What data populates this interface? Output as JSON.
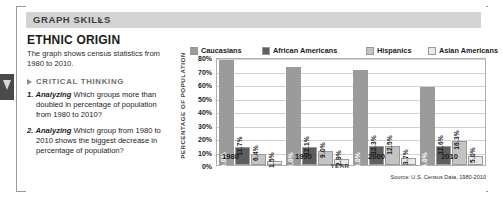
{
  "header": {
    "title": "GRAPH SKILLS",
    "chevron": "›"
  },
  "left": {
    "section_title": "ETHNIC ORIGIN",
    "description": "The graph shows census statistics from 1980 to 2010.",
    "critical_thinking_label": "CRITICAL THINKING",
    "questions": [
      {
        "num": "1.",
        "verb": "Analyzing",
        "text": "Which groups more than doubled in percentage of population from 1980 to 2010?"
      },
      {
        "num": "2.",
        "verb": "Analyzing",
        "text": "Which group from 1980 to 2010 shows the biggest decrease in percentage of population?"
      }
    ]
  },
  "colors": {
    "caucasians": "#9b9b9b",
    "african_americans": "#5e5e5e",
    "hispanics": "#c4c4c4",
    "asian_americans": "#e8e8e8",
    "header_band": "#d4d4d4",
    "grid": "#d2d2d2"
  },
  "chart_data": {
    "type": "bar",
    "title": "",
    "xlabel": "YEAR",
    "ylabel": "PERCENTAGE OF POPULATION",
    "ylim": [
      0,
      80
    ],
    "ytick_labels": [
      "80%",
      "70%",
      "60%",
      "50%",
      "40%",
      "30%",
      "20%",
      "10%",
      "0%"
    ],
    "ytick_values": [
      80,
      70,
      60,
      50,
      40,
      30,
      20,
      10,
      0
    ],
    "grid": true,
    "legend_position": "top",
    "categories": [
      "1980",
      "1990",
      "2000",
      "2010"
    ],
    "series": [
      {
        "name": "Caucasians",
        "color": "#9b9b9b",
        "values": [
          76.0,
          71.0,
          69.0,
          56.0
        ],
        "labels": [
          "76.0%",
          "71.0%",
          "69.0%",
          "56.0%"
        ]
      },
      {
        "name": "African Americans",
        "color": "#5e5e5e",
        "values": [
          11.7,
          12.1,
          12.3,
          12.6
        ],
        "labels": [
          "11.7%",
          "12.1%",
          "12.3%",
          "12.6%"
        ]
      },
      {
        "name": "Hispanics",
        "color": "#c4c4c4",
        "values": [
          6.4,
          9.0,
          12.5,
          16.3
        ],
        "labels": [
          "6.4%",
          "9.0%",
          "12.5%",
          "16.3%"
        ]
      },
      {
        "name": "Asian Americans",
        "color": "#e8e8e8",
        "values": [
          1.5,
          2.9,
          3.7,
          5.0
        ],
        "labels": [
          "1.5%",
          "2.9%",
          "3.7%",
          "5.0%"
        ]
      }
    ],
    "source": "Source: U.S. Census Data, 1980-2010"
  }
}
